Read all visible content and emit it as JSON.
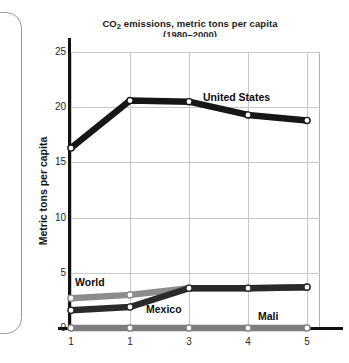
{
  "panel": {
    "name": "left-rounded-panel"
  },
  "chart_data": {
    "type": "line",
    "title_main": "CO",
    "title_sub": "2",
    "title_rest": " emissions, metric tons per capita",
    "title": "CO2 emissions, metric tons per capita",
    "subtitle": "(1980–2000)",
    "xlabel": "",
    "ylabel": "Metric tons per capita",
    "x": [
      1,
      1,
      3,
      4,
      5
    ],
    "xtick_labels": [
      "1",
      "1",
      "3",
      "4",
      "5"
    ],
    "ylim": [
      0,
      25
    ],
    "ytick_labels": [
      "0",
      "5",
      "10",
      "15",
      "20",
      "25"
    ],
    "yticks": [
      0,
      5,
      10,
      15,
      20,
      25
    ],
    "grid": true,
    "legend": "inline-labels",
    "series": [
      {
        "name": "United States",
        "color": "#161616",
        "marker": "open-circle",
        "values": [
          16.3,
          20.6,
          20.5,
          19.3,
          18.8
        ]
      },
      {
        "name": "World",
        "color": "#8c8c8c",
        "marker": "open-circle",
        "values": [
          2.7,
          3.0,
          3.6,
          3.6,
          3.7
        ]
      },
      {
        "name": "Mexico",
        "color": "#2a2a2a",
        "marker": "open-circle",
        "values": [
          1.6,
          1.9,
          3.6,
          3.6,
          3.7
        ]
      },
      {
        "name": "Mali",
        "color": "#7d7d7d",
        "marker": "open-circle",
        "values": [
          0.0,
          0.0,
          0.0,
          0.0,
          0.0
        ]
      }
    ]
  }
}
